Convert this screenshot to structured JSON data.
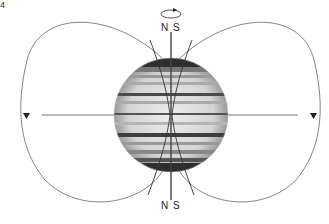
{
  "figure": {
    "number_label": "4"
  },
  "labels": {
    "top_north": "N",
    "top_south": "S",
    "bottom_north": "N",
    "bottom_south": "S"
  },
  "icons": {
    "rotation_arrow": "counterclockwise-rotation-arrow-icon",
    "field_direction_left": "down-triangle-arrow-icon",
    "field_direction_right": "down-triangle-arrow-icon"
  },
  "colors": {
    "line": "#555555",
    "axis": "#444444",
    "planet_dark": "#2a2a2a",
    "planet_light": "#e8e8e8"
  }
}
